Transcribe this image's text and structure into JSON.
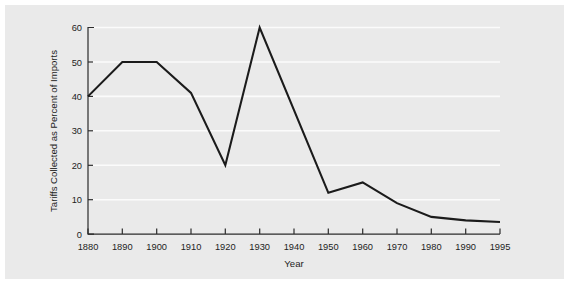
{
  "figure": {
    "background_color": "#eaeaea",
    "page_background_color": "#ffffff",
    "line_color": "#1b1b1b",
    "grid_color": "#fbfbfb",
    "axis_color": "#2b2b2b"
  },
  "chart_data": {
    "type": "line",
    "title": "",
    "subtitle": "",
    "xlabel": "Year",
    "ylabel": "Tariffs Collected as Percent of Imports",
    "categories": [
      "1880",
      "1890",
      "1900",
      "1910",
      "1920",
      "1930",
      "1940",
      "1950",
      "1960",
      "1970",
      "1980",
      "1990",
      "1995"
    ],
    "x": [
      1880,
      1890,
      1900,
      1910,
      1920,
      1930,
      1940,
      1950,
      1960,
      1970,
      1980,
      1990,
      1995
    ],
    "values": [
      40,
      50,
      50,
      41,
      20,
      60,
      36,
      12,
      15,
      9,
      5,
      4,
      3.5
    ],
    "series": [
      {
        "name": "Tariffs Collected as Percent of Imports",
        "values": [
          40,
          50,
          50,
          41,
          20,
          60,
          36,
          12,
          15,
          9,
          5,
          4,
          3.5
        ]
      }
    ],
    "xtick_labels": [
      "1880",
      "1890",
      "1900",
      "1910",
      "1920",
      "1930",
      "1940",
      "1950",
      "1960",
      "1970",
      "1980",
      "1990",
      "1995"
    ],
    "ytick_labels": [
      "0",
      "10",
      "20",
      "30",
      "40",
      "50",
      "60"
    ],
    "yticks": [
      0,
      10,
      20,
      30,
      40,
      50,
      60
    ],
    "ylim": [
      0,
      60
    ],
    "grid": "horizontal",
    "legend": "none",
    "annotations": []
  }
}
